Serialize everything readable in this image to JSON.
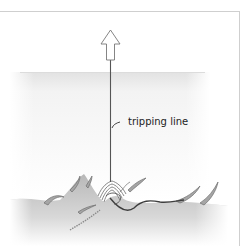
{
  "diagram": {
    "labels": {
      "tripping_line": "tripping line"
    },
    "elements": {
      "arrow": "up-arrow",
      "line": "tripping-line",
      "water": "water-body",
      "seabed": "seabed",
      "anchor": "anchor",
      "weeds": "seaweed"
    },
    "colors": {
      "border": "#c8c8c8",
      "line": "#555555",
      "water_top": "#e6e6e6",
      "seabed": "#bdbdbd",
      "weed_fill": "#9a9a9a",
      "anchor_chain": "#444444"
    }
  }
}
